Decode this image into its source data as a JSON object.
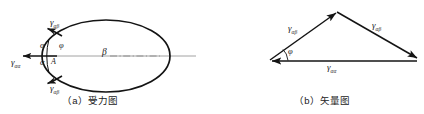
{
  "figure": {
    "background_color": "#ffffff",
    "stroke_color": "#141414",
    "centerline_color": "#8a8a8a"
  },
  "panel_a": {
    "caption": "（a）受力图",
    "shape": "ellipse",
    "labels": {
      "gamma_alpha_beta_top": {
        "symbol": "γ",
        "subscript": "αβ"
      },
      "gamma_alpha_beta_bottom": {
        "symbol": "γ",
        "subscript": "αβ"
      },
      "gamma_alpha_alpha_left": {
        "symbol": "γ",
        "subscript": "αα"
      },
      "alpha_upper": "α",
      "alpha_lower": "α",
      "phi": "φ",
      "point_a": "A",
      "beta": "β"
    }
  },
  "panel_b": {
    "caption": "（b）矢量图",
    "shape": "vector-triangle",
    "labels": {
      "gamma_alpha_beta_left": {
        "symbol": "γ",
        "subscript": "αβ"
      },
      "gamma_alpha_beta_right": {
        "symbol": "γ",
        "subscript": "αβ"
      },
      "gamma_alpha_alpha_base": {
        "symbol": "γ",
        "subscript": "αα"
      },
      "phi": "φ"
    }
  }
}
